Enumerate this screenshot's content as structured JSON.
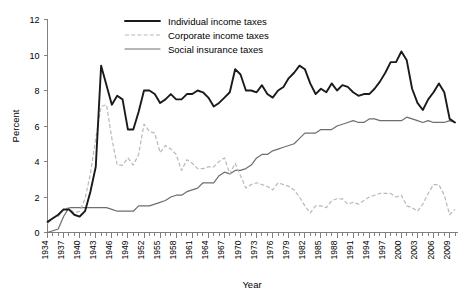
{
  "chart_data": {
    "type": "line",
    "title": "",
    "xlabel": "Year",
    "ylabel": "Percent",
    "xlim": [
      1934,
      2010
    ],
    "ylim": [
      0,
      12
    ],
    "ytick_step": 2,
    "yticks": [
      "0",
      "2",
      "4",
      "6",
      "8",
      "10",
      "12"
    ],
    "xtick_step": 3,
    "grid": false,
    "legend_position": "top-center",
    "colors": {
      "individual": "#1a1a1a",
      "corporate": "#b8b8b8",
      "social": "#6e6e6e",
      "axis": "#808080",
      "background": "#ffffff"
    },
    "xticks": [
      "1934",
      "1937",
      "1940",
      "1943",
      "1946",
      "1949",
      "1952",
      "1955",
      "1958",
      "1961",
      "1964",
      "1967",
      "1970",
      "1973",
      "1976",
      "1979",
      "1982",
      "1985",
      "1988",
      "1991",
      "1994",
      "1997",
      "2000",
      "2003",
      "2006",
      "2009"
    ],
    "x": [
      1934,
      1935,
      1936,
      1937,
      1938,
      1939,
      1940,
      1941,
      1942,
      1943,
      1944,
      1945,
      1946,
      1947,
      1948,
      1949,
      1950,
      1951,
      1952,
      1953,
      1954,
      1955,
      1956,
      1957,
      1958,
      1959,
      1960,
      1961,
      1962,
      1963,
      1964,
      1965,
      1966,
      1967,
      1968,
      1969,
      1970,
      1971,
      1972,
      1973,
      1974,
      1975,
      1976,
      1977,
      1978,
      1979,
      1980,
      1981,
      1982,
      1983,
      1984,
      1985,
      1986,
      1987,
      1988,
      1989,
      1990,
      1991,
      1992,
      1993,
      1994,
      1995,
      1996,
      1997,
      1998,
      1999,
      2000,
      2001,
      2002,
      2003,
      2004,
      2005,
      2006,
      2007,
      2008,
      2009,
      2010
    ],
    "series": [
      {
        "name": "Individual income taxes",
        "style": "solid-thick",
        "color": "#1a1a1a",
        "values": [
          0.6,
          0.8,
          1.0,
          1.3,
          1.3,
          1.0,
          0.9,
          1.2,
          2.3,
          3.7,
          9.4,
          8.3,
          7.2,
          7.7,
          7.5,
          5.8,
          5.8,
          6.8,
          8.0,
          8.0,
          7.8,
          7.3,
          7.5,
          7.8,
          7.5,
          7.5,
          7.8,
          7.8,
          8.0,
          7.9,
          7.6,
          7.1,
          7.3,
          7.6,
          7.9,
          9.2,
          8.9,
          8.0,
          8.0,
          7.9,
          8.3,
          7.8,
          7.6,
          8.0,
          8.2,
          8.7,
          9.0,
          9.4,
          9.2,
          8.4,
          7.8,
          8.1,
          7.9,
          8.4,
          8.0,
          8.3,
          8.2,
          7.9,
          7.7,
          7.8,
          7.8,
          8.1,
          8.5,
          9.0,
          9.6,
          9.6,
          10.2,
          9.7,
          8.1,
          7.3,
          6.9,
          7.5,
          7.9,
          8.4,
          7.9,
          6.4,
          6.2
        ]
      },
      {
        "name": "Corporate income taxes",
        "style": "dashed",
        "color": "#b8b8b8",
        "values": [
          0.5,
          0.8,
          0.9,
          1.3,
          1.4,
          1.1,
          1.2,
          1.9,
          3.3,
          5.3,
          7.1,
          7.2,
          5.3,
          3.8,
          3.8,
          4.2,
          3.8,
          4.4,
          6.1,
          5.7,
          5.6,
          4.5,
          4.9,
          4.7,
          4.4,
          3.5,
          4.1,
          3.9,
          3.6,
          3.6,
          3.7,
          3.7,
          4.0,
          4.2,
          3.3,
          3.9,
          3.2,
          2.5,
          2.7,
          2.8,
          2.7,
          2.6,
          2.4,
          2.8,
          2.7,
          2.6,
          2.4,
          2.0,
          1.5,
          1.1,
          1.5,
          1.5,
          1.4,
          1.8,
          1.9,
          1.9,
          1.6,
          1.7,
          1.6,
          1.8,
          2.0,
          2.1,
          2.2,
          2.2,
          2.2,
          2.0,
          2.1,
          1.5,
          1.4,
          1.2,
          1.6,
          2.2,
          2.7,
          2.7,
          2.1,
          1.0,
          1.3
        ]
      },
      {
        "name": "Social insurance taxes",
        "style": "solid-thin",
        "color": "#6e6e6e",
        "values": [
          0.0,
          0.1,
          0.2,
          0.9,
          1.4,
          1.4,
          1.4,
          1.4,
          1.4,
          1.4,
          1.4,
          1.4,
          1.3,
          1.2,
          1.2,
          1.2,
          1.2,
          1.5,
          1.5,
          1.5,
          1.6,
          1.7,
          1.8,
          2.0,
          2.1,
          2.1,
          2.3,
          2.4,
          2.5,
          2.8,
          2.8,
          2.8,
          3.2,
          3.4,
          3.3,
          3.5,
          3.5,
          3.6,
          3.8,
          4.2,
          4.4,
          4.4,
          4.6,
          4.7,
          4.8,
          4.9,
          5.0,
          5.3,
          5.6,
          5.6,
          5.6,
          5.8,
          5.8,
          5.8,
          6.0,
          6.1,
          6.2,
          6.3,
          6.2,
          6.2,
          6.4,
          6.4,
          6.3,
          6.3,
          6.3,
          6.3,
          6.3,
          6.5,
          6.4,
          6.3,
          6.2,
          6.3,
          6.2,
          6.2,
          6.2,
          6.3,
          6.2
        ]
      }
    ]
  },
  "legend": {
    "items": [
      {
        "label": "Individual income taxes"
      },
      {
        "label": "Corporate income taxes"
      },
      {
        "label": "Social insurance taxes"
      }
    ]
  },
  "axes": {
    "y_title": "Percent",
    "x_title": "Year"
  }
}
